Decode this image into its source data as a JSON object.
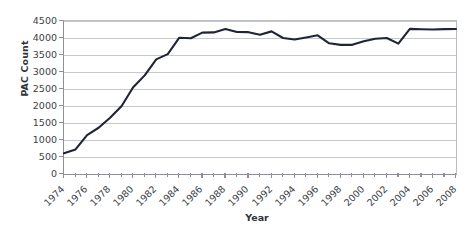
{
  "chart_data": {
    "type": "line",
    "title": "",
    "xlabel": "Year",
    "ylabel": "PAC Count",
    "xlim": [
      1974,
      2008
    ],
    "ylim": [
      0,
      4500
    ],
    "grid": true,
    "legend": null,
    "line_color": "#1f2438",
    "x": [
      1974,
      1975,
      1976,
      1977,
      1978,
      1979,
      1980,
      1981,
      1982,
      1983,
      1984,
      1985,
      1986,
      1987,
      1988,
      1989,
      1990,
      1991,
      1992,
      1993,
      1994,
      1995,
      1996,
      1997,
      1998,
      1999,
      2000,
      2001,
      2002,
      2003,
      2004,
      2005,
      2006,
      2007,
      2008
    ],
    "values": [
      608,
      722,
      1146,
      1360,
      1653,
      2000,
      2551,
      2901,
      3371,
      3525,
      4009,
      3992,
      4157,
      4165,
      4268,
      4178,
      4172,
      4094,
      4195,
      4000,
      3954,
      4016,
      4079,
      3844,
      3798,
      3798,
      3907,
      3976,
      4000,
      3835,
      4267,
      4256,
      4250,
      4260,
      4266
    ],
    "x_tick_labels": [
      "1974",
      "1976",
      "1978",
      "1980",
      "1982",
      "1984",
      "1986",
      "1988",
      "1990",
      "1992",
      "1994",
      "1996",
      "1998",
      "2000",
      "2002",
      "2004",
      "2006",
      "2008"
    ],
    "x_tick_values": [
      1974,
      1976,
      1978,
      1980,
      1982,
      1984,
      1986,
      1988,
      1990,
      1992,
      1994,
      1996,
      1998,
      2000,
      2002,
      2004,
      2006,
      2008
    ],
    "y_tick_labels": [
      "0",
      "500",
      "1000",
      "1500",
      "2000",
      "2500",
      "3000",
      "3500",
      "4000",
      "4500"
    ],
    "y_tick_values": [
      0,
      500,
      1000,
      1500,
      2000,
      2500,
      3000,
      3500,
      4000,
      4500
    ]
  }
}
